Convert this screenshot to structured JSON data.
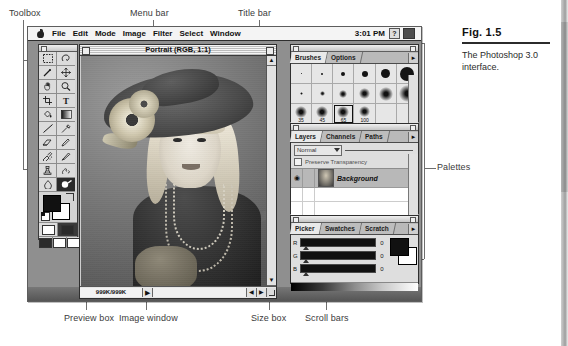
{
  "figure": {
    "number": "Fig. 1.5",
    "caption": "The Photoshop 3.0 interface."
  },
  "callouts": {
    "toolbox": "Toolbox",
    "menu_bar": "Menu bar",
    "title_bar": "Title bar",
    "palettes": "Palettes",
    "preview_box": "Preview box",
    "image_window": "Image window",
    "size_box": "Size box",
    "scroll_bars": "Scroll bars"
  },
  "menubar": {
    "apple": "apple-logo",
    "items": [
      "File",
      "Edit",
      "Mode",
      "Image",
      "Filter",
      "Select",
      "Window"
    ],
    "clock": "3:01 PM",
    "help_icon": "?",
    "app_icon": "photoshop-app-icon"
  },
  "image_window": {
    "title": "Portrait (RGB, 1:1)",
    "preview_box": "999K/999K",
    "scroll_right_arrow": "▶",
    "scroll_left_arrow": "◀",
    "scroll_up_arrow": "▲",
    "scroll_down_arrow": "▼"
  },
  "toolbox": {
    "tools": [
      "marquee-tool",
      "lasso-tool",
      "magic-wand-tool",
      "move-tool",
      "hand-tool",
      "zoom-tool",
      "crop-tool",
      "type-tool",
      "paint-bucket-tool",
      "gradient-tool",
      "line-tool",
      "eyedropper-tool",
      "eraser-tool",
      "pencil-tool",
      "airbrush-tool",
      "paintbrush-tool",
      "rubber-stamp-tool",
      "smudge-tool",
      "blur-tool",
      "dodge-burn-tool"
    ],
    "selected_tool": "dodge-burn-tool",
    "foreground_color": "#111111",
    "background_color": "#ffffff",
    "mask_modes": [
      "standard-mode",
      "quick-mask-mode"
    ],
    "screen_modes": [
      "standard-screen",
      "full-screen-menubar",
      "full-screen"
    ]
  },
  "palettes": {
    "brushes": {
      "tabs": [
        "Brushes",
        "Options"
      ],
      "active_tab": "Brushes",
      "brush_labels": [
        "35",
        "45",
        "65",
        "100"
      ],
      "selected_brush": "65"
    },
    "layers": {
      "tabs": [
        "Layers",
        "Channels",
        "Paths"
      ],
      "active_tab": "Layers",
      "blend_mode": "Normal",
      "preserve_transparency": "Preserve Transparency",
      "rows": [
        {
          "name": "Background",
          "visible": "◉"
        }
      ]
    },
    "picker": {
      "tabs": [
        "Picker",
        "Swatches",
        "Scratch"
      ],
      "active_tab": "Picker",
      "channels": [
        {
          "label": "R",
          "value": "0"
        },
        {
          "label": "G",
          "value": "0"
        },
        {
          "label": "B",
          "value": "0"
        }
      ],
      "foreground_color": "#111111",
      "background_color": "#ffffff"
    }
  }
}
